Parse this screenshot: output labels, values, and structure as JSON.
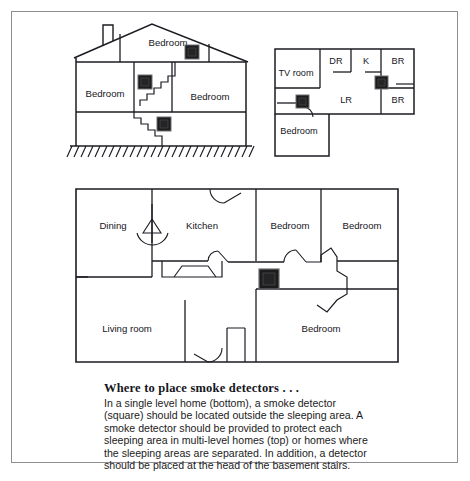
{
  "figure": {
    "name": "smoke-detector-placement-diagram",
    "border_color": "#8d8d92",
    "line_color": "#1b1b22",
    "detector_fill": "#1c1c1c",
    "background": "#ffffff"
  },
  "cross_section": {
    "name": "multi-level-home-cross-section",
    "position": "top-left",
    "rooms": [
      {
        "label": "Bedroom",
        "level": "attic",
        "x": 168,
        "y": 46
      },
      {
        "label": "Bedroom",
        "level": "main-left",
        "x": 110,
        "y": 97
      },
      {
        "label": "Bedroom",
        "level": "main-right",
        "x": 215,
        "y": 100
      }
    ],
    "detectors": [
      {
        "name": "detector-attic",
        "x": 192,
        "y": 52
      },
      {
        "name": "detector-upper-hall",
        "x": 144,
        "y": 82
      },
      {
        "name": "detector-basement-stairs",
        "x": 163,
        "y": 124
      }
    ],
    "features": [
      "chimney",
      "gable-roof",
      "staircase",
      "ground-hatching"
    ]
  },
  "upper_floorplan": {
    "name": "multi-level-home-floorplan",
    "position": "top-right",
    "rooms": [
      {
        "label": "TV room",
        "x": 296,
        "y": 73
      },
      {
        "label": "DR",
        "x": 335,
        "y": 63
      },
      {
        "label": "K",
        "x": 367,
        "y": 63
      },
      {
        "label": "BR",
        "x": 397,
        "y": 63
      },
      {
        "label": "LR",
        "x": 345,
        "y": 100
      },
      {
        "label": "BR",
        "x": 397,
        "y": 101
      },
      {
        "label": "Bedroom",
        "x": 296,
        "y": 131
      }
    ],
    "detectors": [
      {
        "name": "detector-hall-upper-right",
        "x": 367,
        "y": 82
      },
      {
        "name": "detector-bedroom-hall",
        "x": 302,
        "y": 100
      }
    ]
  },
  "single_level_floorplan": {
    "name": "single-level-home-floorplan",
    "position": "bottom",
    "rooms": [
      {
        "label": "Dining",
        "x": 113,
        "y": 226
      },
      {
        "label": "Kitchen",
        "x": 202,
        "y": 226
      },
      {
        "label": "Bedroom",
        "x": 291,
        "y": 226
      },
      {
        "label": "Bedroom",
        "x": 364,
        "y": 226
      },
      {
        "label": "Living room",
        "x": 124,
        "y": 329
      },
      {
        "label": "Bedroom",
        "x": 318,
        "y": 329
      }
    ],
    "detectors": [
      {
        "name": "detector-central-hall",
        "x": 268,
        "y": 280
      }
    ],
    "features": [
      "door-swings",
      "stairs",
      "hallway"
    ]
  },
  "caption": {
    "title": "Where to place smoke detectors . . .",
    "body": "In a single level home (bottom), a smoke detector (square) should be located outside the sleeping area. A smoke detector should be provided to protect each sleeping area in multi-level homes (top) or homes where the sleeping areas are separated. In addition, a detector should be placed at the head of the basement stairs."
  },
  "footer": {
    "text": ""
  }
}
